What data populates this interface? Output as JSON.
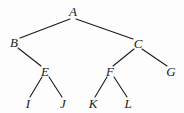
{
  "figure": {
    "type": "binary-tree-diagram",
    "width": 184,
    "height": 113,
    "background_color": "#fdfdfd",
    "stroke_color": "#1a1a1a",
    "label_color": "#1a1a1a"
  },
  "nodes": [
    {
      "id": "A",
      "label": "A",
      "x": 73,
      "y": 11,
      "level": 0,
      "parent": null,
      "children": [
        "B",
        "C"
      ]
    },
    {
      "id": "B",
      "label": "B",
      "x": 14,
      "y": 42,
      "level": 1,
      "parent": "A",
      "children": [
        "E"
      ]
    },
    {
      "id": "C",
      "label": "C",
      "x": 138,
      "y": 43,
      "level": 1,
      "parent": "A",
      "children": [
        "F",
        "G"
      ]
    },
    {
      "id": "E",
      "label": "E",
      "x": 45,
      "y": 71,
      "level": 2,
      "parent": "B",
      "children": [
        "I",
        "J"
      ]
    },
    {
      "id": "F",
      "label": "F",
      "x": 110,
      "y": 71,
      "level": 2,
      "parent": "C",
      "children": [
        "K",
        "L"
      ]
    },
    {
      "id": "G",
      "label": "G",
      "x": 171,
      "y": 71,
      "level": 2,
      "parent": "C",
      "children": []
    },
    {
      "id": "I",
      "label": "I",
      "x": 28,
      "y": 103,
      "level": 3,
      "parent": "E",
      "children": []
    },
    {
      "id": "J",
      "label": "J",
      "x": 63,
      "y": 103,
      "level": 3,
      "parent": "E",
      "children": []
    },
    {
      "id": "K",
      "label": "K",
      "x": 93,
      "y": 103,
      "level": 3,
      "parent": "F",
      "children": []
    },
    {
      "id": "L",
      "label": "L",
      "x": 128,
      "y": 103,
      "level": 3,
      "parent": "F",
      "children": []
    }
  ],
  "edges": [
    {
      "id": "A-B",
      "from": "A",
      "to": "B",
      "x1": 70,
      "y1": 19,
      "x2": 20,
      "y2": 38
    },
    {
      "id": "A-C",
      "from": "A",
      "to": "C",
      "x1": 76,
      "y1": 19,
      "x2": 133,
      "y2": 39
    },
    {
      "id": "B-E",
      "from": "B",
      "to": "E",
      "x1": 18,
      "y1": 48,
      "x2": 41,
      "y2": 66
    },
    {
      "id": "C-F",
      "from": "C",
      "to": "F",
      "x1": 134,
      "y1": 49,
      "x2": 113,
      "y2": 66
    },
    {
      "id": "C-G",
      "from": "C",
      "to": "G",
      "x1": 142,
      "y1": 49,
      "x2": 167,
      "y2": 66
    },
    {
      "id": "E-I",
      "from": "E",
      "to": "I",
      "x1": 42,
      "y1": 77,
      "x2": 30,
      "y2": 97
    },
    {
      "id": "E-J",
      "from": "E",
      "to": "J",
      "x1": 49,
      "y1": 77,
      "x2": 62,
      "y2": 97
    },
    {
      "id": "F-K",
      "from": "F",
      "to": "K",
      "x1": 107,
      "y1": 77,
      "x2": 95,
      "y2": 97
    },
    {
      "id": "F-L",
      "from": "F",
      "to": "L",
      "x1": 114,
      "y1": 77,
      "x2": 127,
      "y2": 97
    }
  ]
}
